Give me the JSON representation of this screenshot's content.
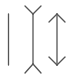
{
  "figure": {
    "title": "",
    "stroke_color": "#555555",
    "background": "#ffffff",
    "lines": [
      {
        "name": "plain-line",
        "type": "plain"
      },
      {
        "name": "fins-out-line",
        "type": "fins-outward"
      },
      {
        "name": "arrowheads-line",
        "type": "arrowheads-inward"
      }
    ]
  }
}
